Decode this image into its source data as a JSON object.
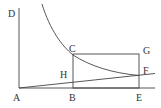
{
  "diagram": {
    "labels": {
      "A": "A",
      "B": "B",
      "C": "C",
      "D": "D",
      "E": "E",
      "F": "F",
      "G": "G",
      "H": "H"
    },
    "elements": [
      "vertical axis AD",
      "horizontal axis AE",
      "hyperbola through C and F",
      "rectangle BCGE",
      "line from A through H and F"
    ],
    "colors": {
      "stroke": "#444444",
      "text": "#333333",
      "background": "#ffffff"
    }
  }
}
